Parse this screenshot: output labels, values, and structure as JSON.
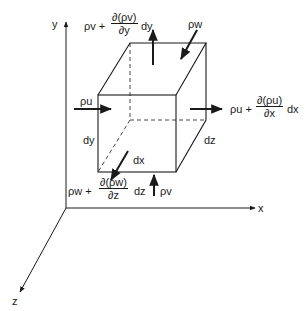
{
  "diagram": {
    "axes": {
      "x": "x",
      "y": "y",
      "z": "z"
    },
    "dimensions": {
      "dx": "dx",
      "dy": "dy",
      "dz": "dz"
    },
    "fluxes": {
      "in_x": "ρu",
      "out_x": {
        "prefix": "ρu +",
        "numerator": "∂(ρu)",
        "denominator": "∂x",
        "suffix": "dx"
      },
      "in_y": "ρv",
      "out_y": {
        "prefix": "ρv +",
        "numerator": "∂(ρv)",
        "denominator": "∂y",
        "suffix": "dy"
      },
      "in_z": "ρw",
      "out_z": {
        "prefix": "ρw +",
        "numerator": "∂(ρw)",
        "denominator": "∂z",
        "suffix": "dz"
      }
    },
    "colors": {
      "stroke": "#1a1a1a",
      "background": "#ffffff"
    }
  }
}
